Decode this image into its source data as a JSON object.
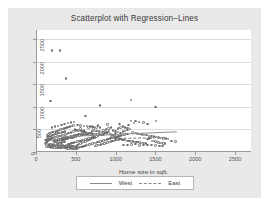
{
  "chart_data": {
    "type": "scatter",
    "title": "Scatterplot with Regression−Lines",
    "xlabel": "Home size in sqft.",
    "ylabel": "",
    "xlim": [
      0,
      2700
    ],
    "ylim": [
      0,
      2700
    ],
    "xticks": [
      0,
      500,
      1000,
      1500,
      2000,
      2500
    ],
    "yticks": [
      0,
      500,
      1000,
      1500,
      2000,
      2500
    ],
    "grid": "horizontal",
    "legend_position": "below-plot",
    "marker": "open-circle",
    "colors": {
      "marker": "#6d6d6d",
      "west_line": "#8e8e8e",
      "east_line": "#777777",
      "plot_bg": "#ffffff",
      "graph_bg": "#e9e9e9"
    },
    "series": [
      {
        "name": "West",
        "line_style": "solid",
        "regression_line": {
          "x0": 120,
          "y0": 330,
          "x1": 1760,
          "y1": 455
        }
      },
      {
        "name": "East",
        "line_style": "dashed",
        "regression_line": {
          "x0": 980,
          "y0": 300,
          "x1": 1620,
          "y1": 320
        }
      }
    ],
    "points": [
      [
        200,
        2250
      ],
      [
        300,
        2250
      ],
      [
        380,
        1630
      ],
      [
        180,
        1130
      ],
      [
        800,
        1030
      ],
      [
        1190,
        1155
      ],
      [
        1500,
        1000
      ],
      [
        620,
        800
      ],
      [
        1510,
        680
      ],
      [
        1230,
        640
      ],
      [
        1350,
        650
      ],
      [
        1290,
        660
      ],
      [
        1050,
        620
      ],
      [
        900,
        610
      ],
      [
        780,
        590
      ],
      [
        700,
        560
      ],
      [
        1160,
        600
      ],
      [
        1400,
        620
      ],
      [
        1190,
        680
      ],
      [
        1250,
        690
      ],
      [
        660,
        540
      ],
      [
        720,
        520
      ],
      [
        560,
        520
      ],
      [
        600,
        480
      ],
      [
        500,
        470
      ],
      [
        470,
        450
      ],
      [
        440,
        430
      ],
      [
        410,
        420
      ],
      [
        390,
        400
      ],
      [
        370,
        390
      ],
      [
        350,
        380
      ],
      [
        330,
        370
      ],
      [
        310,
        360
      ],
      [
        290,
        350
      ],
      [
        270,
        340
      ],
      [
        250,
        330
      ],
      [
        230,
        320
      ],
      [
        215,
        310
      ],
      [
        200,
        300
      ],
      [
        190,
        290
      ],
      [
        180,
        280
      ],
      [
        170,
        270
      ],
      [
        160,
        260
      ],
      [
        150,
        250
      ],
      [
        145,
        240
      ],
      [
        140,
        230
      ],
      [
        135,
        220
      ],
      [
        130,
        210
      ],
      [
        125,
        200
      ],
      [
        120,
        190
      ],
      [
        160,
        180
      ],
      [
        180,
        170
      ],
      [
        200,
        165
      ],
      [
        220,
        160
      ],
      [
        240,
        155
      ],
      [
        260,
        150
      ],
      [
        280,
        148
      ],
      [
        300,
        145
      ],
      [
        320,
        142
      ],
      [
        340,
        140
      ],
      [
        360,
        138
      ],
      [
        380,
        136
      ],
      [
        400,
        134
      ],
      [
        420,
        132
      ],
      [
        440,
        130
      ],
      [
        460,
        128
      ],
      [
        480,
        126
      ],
      [
        500,
        124
      ],
      [
        520,
        160
      ],
      [
        540,
        175
      ],
      [
        560,
        190
      ],
      [
        580,
        205
      ],
      [
        600,
        220
      ],
      [
        620,
        235
      ],
      [
        640,
        250
      ],
      [
        660,
        265
      ],
      [
        680,
        280
      ],
      [
        700,
        295
      ],
      [
        720,
        310
      ],
      [
        740,
        325
      ],
      [
        760,
        340
      ],
      [
        780,
        355
      ],
      [
        800,
        370
      ],
      [
        820,
        385
      ],
      [
        840,
        400
      ],
      [
        860,
        415
      ],
      [
        880,
        430
      ],
      [
        900,
        445
      ],
      [
        920,
        460
      ],
      [
        940,
        400
      ],
      [
        960,
        380
      ],
      [
        980,
        360
      ],
      [
        1000,
        340
      ],
      [
        1020,
        320
      ],
      [
        1040,
        300
      ],
      [
        1060,
        290
      ],
      [
        1080,
        280
      ],
      [
        1100,
        270
      ],
      [
        1120,
        260
      ],
      [
        1140,
        250
      ],
      [
        1160,
        245
      ],
      [
        1180,
        240
      ],
      [
        1200,
        235
      ],
      [
        1220,
        230
      ],
      [
        1240,
        225
      ],
      [
        1260,
        220
      ],
      [
        1280,
        215
      ],
      [
        1300,
        210
      ],
      [
        1320,
        205
      ],
      [
        1340,
        200
      ],
      [
        1360,
        195
      ],
      [
        1380,
        190
      ],
      [
        1400,
        290
      ],
      [
        1420,
        300
      ],
      [
        1440,
        310
      ],
      [
        1460,
        250
      ],
      [
        1480,
        240
      ],
      [
        1500,
        230
      ],
      [
        1520,
        220
      ],
      [
        1540,
        210
      ],
      [
        1560,
        200
      ],
      [
        1580,
        195
      ],
      [
        1600,
        190
      ],
      [
        1620,
        185
      ],
      [
        1750,
        230
      ],
      [
        1700,
        250
      ],
      [
        230,
        430
      ],
      [
        250,
        450
      ],
      [
        270,
        470
      ],
      [
        290,
        490
      ],
      [
        310,
        500
      ],
      [
        330,
        510
      ],
      [
        350,
        520
      ],
      [
        370,
        530
      ],
      [
        390,
        545
      ],
      [
        410,
        555
      ],
      [
        430,
        565
      ],
      [
        450,
        575
      ],
      [
        470,
        585
      ],
      [
        490,
        500
      ],
      [
        510,
        490
      ],
      [
        530,
        480
      ],
      [
        550,
        470
      ],
      [
        570,
        460
      ],
      [
        590,
        450
      ],
      [
        610,
        440
      ],
      [
        630,
        430
      ],
      [
        650,
        420
      ],
      [
        670,
        415
      ],
      [
        690,
        410
      ],
      [
        710,
        405
      ],
      [
        730,
        400
      ],
      [
        750,
        395
      ],
      [
        770,
        390
      ],
      [
        790,
        385
      ],
      [
        810,
        380
      ],
      [
        830,
        375
      ],
      [
        850,
        370
      ],
      [
        140,
        370
      ],
      [
        155,
        390
      ],
      [
        170,
        410
      ],
      [
        185,
        425
      ],
      [
        205,
        440
      ],
      [
        225,
        205
      ],
      [
        245,
        215
      ],
      [
        265,
        225
      ],
      [
        285,
        235
      ],
      [
        305,
        245
      ],
      [
        325,
        255
      ],
      [
        345,
        265
      ],
      [
        365,
        275
      ],
      [
        385,
        285
      ],
      [
        405,
        295
      ],
      [
        425,
        305
      ],
      [
        445,
        315
      ],
      [
        465,
        325
      ],
      [
        485,
        335
      ],
      [
        505,
        345
      ],
      [
        525,
        355
      ],
      [
        545,
        365
      ],
      [
        565,
        375
      ],
      [
        585,
        380
      ],
      [
        605,
        385
      ],
      [
        625,
        390
      ],
      [
        645,
        395
      ],
      [
        665,
        398
      ],
      [
        130,
        120
      ],
      [
        150,
        110
      ],
      [
        170,
        105
      ],
      [
        190,
        100
      ],
      [
        210,
        98
      ],
      [
        230,
        96
      ],
      [
        250,
        94
      ],
      [
        270,
        92
      ],
      [
        290,
        90
      ],
      [
        310,
        88
      ],
      [
        330,
        86
      ],
      [
        350,
        84
      ],
      [
        370,
        82
      ],
      [
        390,
        80
      ],
      [
        410,
        78
      ],
      [
        430,
        76
      ],
      [
        450,
        74
      ],
      [
        470,
        72
      ],
      [
        490,
        70
      ],
      [
        510,
        68
      ],
      [
        530,
        95
      ],
      [
        550,
        105
      ],
      [
        570,
        115
      ],
      [
        590,
        125
      ],
      [
        610,
        135
      ],
      [
        630,
        145
      ],
      [
        650,
        155
      ],
      [
        670,
        165
      ],
      [
        690,
        175
      ],
      [
        710,
        185
      ],
      [
        730,
        195
      ],
      [
        750,
        205
      ],
      [
        770,
        215
      ],
      [
        790,
        225
      ],
      [
        810,
        235
      ],
      [
        830,
        245
      ],
      [
        850,
        255
      ],
      [
        870,
        265
      ],
      [
        890,
        275
      ],
      [
        910,
        285
      ],
      [
        930,
        295
      ],
      [
        950,
        305
      ],
      [
        970,
        315
      ],
      [
        990,
        325
      ],
      [
        1010,
        335
      ],
      [
        1030,
        345
      ],
      [
        1050,
        355
      ],
      [
        1070,
        365
      ],
      [
        1090,
        375
      ],
      [
        1110,
        385
      ],
      [
        1130,
        395
      ],
      [
        1150,
        405
      ],
      [
        200,
        540
      ],
      [
        240,
        560
      ],
      [
        280,
        580
      ],
      [
        320,
        600
      ],
      [
        360,
        620
      ],
      [
        400,
        640
      ],
      [
        440,
        655
      ],
      [
        480,
        665
      ],
      [
        520,
        600
      ],
      [
        560,
        590
      ],
      [
        600,
        580
      ],
      [
        640,
        570
      ],
      [
        680,
        560
      ],
      [
        720,
        550
      ],
      [
        760,
        545
      ],
      [
        800,
        540
      ],
      [
        120,
        260
      ],
      [
        135,
        275
      ],
      [
        150,
        290
      ],
      [
        165,
        305
      ],
      [
        180,
        318
      ],
      [
        195,
        330
      ],
      [
        210,
        250
      ],
      [
        225,
        255
      ],
      [
        240,
        260
      ],
      [
        255,
        265
      ],
      [
        270,
        272
      ],
      [
        285,
        278
      ],
      [
        300,
        285
      ],
      [
        315,
        292
      ],
      [
        330,
        298
      ],
      [
        345,
        305
      ],
      [
        360,
        312
      ],
      [
        375,
        318
      ],
      [
        390,
        325
      ],
      [
        405,
        332
      ],
      [
        420,
        338
      ],
      [
        435,
        345
      ],
      [
        450,
        352
      ],
      [
        465,
        358
      ],
      [
        480,
        365
      ],
      [
        495,
        372
      ],
      [
        510,
        378
      ],
      [
        525,
        385
      ],
      [
        540,
        392
      ],
      [
        555,
        398
      ],
      [
        570,
        405
      ],
      [
        585,
        412
      ],
      [
        850,
        480
      ],
      [
        880,
        500
      ],
      [
        910,
        520
      ],
      [
        940,
        540
      ],
      [
        970,
        480
      ],
      [
        1000,
        460
      ],
      [
        1030,
        440
      ],
      [
        1060,
        420
      ],
      [
        1090,
        455
      ],
      [
        1120,
        470
      ],
      [
        1150,
        490
      ],
      [
        1180,
        510
      ],
      [
        1210,
        430
      ],
      [
        1240,
        420
      ],
      [
        1270,
        410
      ],
      [
        1300,
        400
      ],
      [
        1330,
        390
      ],
      [
        1360,
        380
      ],
      [
        1390,
        370
      ],
      [
        1420,
        360
      ],
      [
        1450,
        350
      ],
      [
        1480,
        340
      ],
      [
        1510,
        330
      ],
      [
        1540,
        320
      ],
      [
        1570,
        310
      ],
      [
        1600,
        300
      ],
      [
        1630,
        295
      ],
      [
        1660,
        290
      ],
      [
        260,
        175
      ],
      [
        280,
        185
      ],
      [
        300,
        195
      ],
      [
        320,
        205
      ],
      [
        340,
        215
      ],
      [
        360,
        225
      ],
      [
        380,
        160
      ],
      [
        400,
        170
      ],
      [
        420,
        180
      ],
      [
        440,
        190
      ],
      [
        460,
        200
      ],
      [
        480,
        210
      ],
      [
        500,
        218
      ],
      [
        520,
        228
      ],
      [
        540,
        238
      ],
      [
        560,
        248
      ],
      [
        580,
        258
      ],
      [
        600,
        268
      ],
      [
        620,
        278
      ],
      [
        640,
        288
      ],
      [
        660,
        298
      ],
      [
        680,
        308
      ],
      [
        700,
        318
      ],
      [
        720,
        328
      ],
      [
        740,
        130
      ],
      [
        760,
        140
      ],
      [
        780,
        150
      ],
      [
        800,
        160
      ],
      [
        820,
        170
      ],
      [
        840,
        180
      ],
      [
        860,
        190
      ],
      [
        880,
        200
      ],
      [
        900,
        210
      ],
      [
        920,
        220
      ],
      [
        940,
        230
      ],
      [
        960,
        240
      ],
      [
        980,
        250
      ],
      [
        1000,
        260
      ],
      [
        1020,
        270
      ],
      [
        1040,
        280
      ],
      [
        1100,
        150
      ],
      [
        1150,
        160
      ],
      [
        1200,
        170
      ],
      [
        1250,
        180
      ],
      [
        1300,
        145
      ],
      [
        1350,
        150
      ],
      [
        1400,
        155
      ],
      [
        1450,
        160
      ],
      [
        1500,
        140
      ],
      [
        1550,
        135
      ],
      [
        1590,
        130
      ],
      [
        155,
        150
      ],
      [
        175,
        145
      ],
      [
        195,
        140
      ],
      [
        215,
        135
      ],
      [
        235,
        130
      ],
      [
        255,
        128
      ],
      [
        275,
        126
      ],
      [
        295,
        124
      ],
      [
        315,
        122
      ],
      [
        335,
        120
      ],
      [
        355,
        118
      ],
      [
        375,
        116
      ],
      [
        395,
        114
      ],
      [
        415,
        112
      ],
      [
        435,
        110
      ],
      [
        455,
        108
      ],
      [
        475,
        106
      ],
      [
        495,
        104
      ],
      [
        515,
        102
      ],
      [
        535,
        100
      ],
      [
        145,
        330
      ],
      [
        165,
        345
      ],
      [
        185,
        358
      ],
      [
        205,
        370
      ],
      [
        225,
        382
      ],
      [
        245,
        395
      ],
      [
        265,
        405
      ],
      [
        285,
        415
      ],
      [
        305,
        425
      ],
      [
        325,
        435
      ],
      [
        345,
        445
      ],
      [
        365,
        455
      ],
      [
        700,
        450
      ],
      [
        730,
        460
      ],
      [
        760,
        470
      ],
      [
        790,
        450
      ],
      [
        820,
        440
      ],
      [
        850,
        430
      ],
      [
        880,
        420
      ],
      [
        910,
        410
      ],
      [
        940,
        355
      ],
      [
        970,
        350
      ],
      [
        1000,
        420
      ],
      [
        1030,
        520
      ],
      [
        1060,
        540
      ],
      [
        1090,
        560
      ],
      [
        1120,
        545
      ],
      [
        1150,
        530
      ]
    ]
  },
  "legend": {
    "items": [
      {
        "label": "West",
        "style": "solid"
      },
      {
        "label": "East",
        "style": "dashed"
      }
    ]
  }
}
